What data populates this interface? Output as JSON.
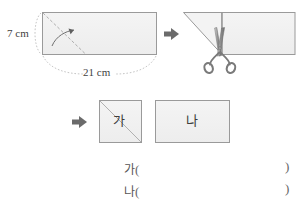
{
  "figure": {
    "title_visible": false,
    "step1": {
      "name": "folded-rectangle-with-dimensions",
      "width_label": "21 cm",
      "height_label": "7 cm",
      "fold_arrow": "curved-fold-arrow"
    },
    "arrow1": "right-arrow",
    "step2": {
      "name": "folded-shape-being-cut",
      "tool": "scissors-icon"
    },
    "arrow2": "right-arrow",
    "step3": {
      "pieces": [
        {
          "label": "가",
          "shape": "square-with-diagonal"
        },
        {
          "label": "나",
          "shape": "rectangle"
        }
      ]
    }
  },
  "answers": [
    {
      "label": "가",
      "open": "(",
      "close": ")",
      "value": ""
    },
    {
      "label": "나",
      "open": "(",
      "close": ")",
      "value": ""
    }
  ],
  "colors": {
    "paper_fill": "#f1f1f1",
    "paper_stroke": "#9a9a9a",
    "fold_line": "#9c9c9c",
    "arrow": "#6b6b6b",
    "text": "#3f3f3f",
    "scissors": "#7d7d7d"
  }
}
